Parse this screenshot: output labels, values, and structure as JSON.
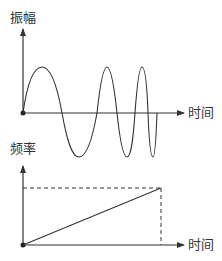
{
  "top_plot": {
    "y_label": "振幅",
    "x_label": "时间",
    "curve": "chirp-sine-wave",
    "description": "Sine wave whose frequency increases over time (linear chirp)"
  },
  "bottom_plot": {
    "y_label": "频率",
    "x_label": "时间",
    "curve": "linear-increasing-frequency",
    "description": "Frequency rises linearly with time, with dashed guide lines to the end value"
  },
  "colors": {
    "axis": "#333333",
    "curve": "#333333",
    "dashed": "#333333",
    "background": "#ffffff"
  }
}
